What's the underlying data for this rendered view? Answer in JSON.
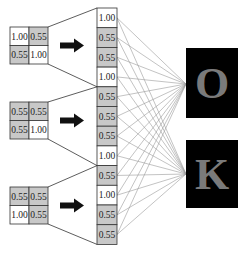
{
  "diagram": {
    "type": "flatten-to-fully-connected",
    "colors": {
      "high_cell": "#ffffff",
      "low_cell": "#c8c8c8",
      "cell_border": "#333333",
      "arrow": "#111111",
      "connection": "#9a9a9a",
      "output_bg": "#000000",
      "output_letter": "#7a7a7a"
    },
    "input_matrices": [
      {
        "cells": [
          [
            "1.00",
            "0.55"
          ],
          [
            "0.55",
            "1.00"
          ]
        ]
      },
      {
        "cells": [
          [
            "0.55",
            "0.55"
          ],
          [
            "0.55",
            "1.00"
          ]
        ]
      },
      {
        "cells": [
          [
            "0.55",
            "0.55"
          ],
          [
            "1.00",
            "0.55"
          ]
        ]
      }
    ],
    "flattened_vector": [
      "1.00",
      "0.55",
      "0.55",
      "1.00",
      "0.55",
      "0.55",
      "0.55",
      "1.00",
      "0.55",
      "1.00",
      "0.55",
      "0.55"
    ],
    "outputs": [
      {
        "label": "O"
      },
      {
        "label": "K"
      }
    ]
  }
}
